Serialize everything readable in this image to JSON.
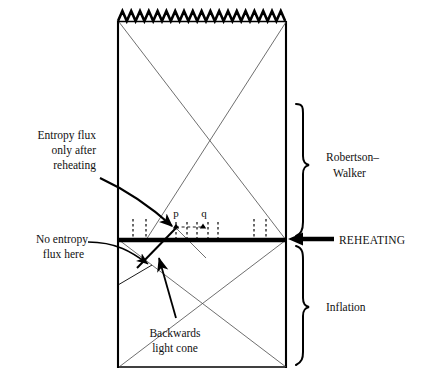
{
  "figure": {
    "background_color": "#ffffff",
    "ink_color": "#000000",
    "thin_line_color": "#3a3a3a"
  },
  "annotations": {
    "entropy_flux_after": {
      "line1": "Entropy  flux",
      "line2": "only  after",
      "line3": "reheating"
    },
    "no_entropy_flux": {
      "line1": "No  entropy",
      "line2": "flux  here"
    },
    "backwards_light_cone": {
      "line1": "Backwards",
      "line2": "light  cone"
    }
  },
  "brackets": {
    "upper": {
      "label_line1": "Robertson–",
      "label_line2": "Walker"
    },
    "lower": {
      "label_line1": "Inflation"
    }
  },
  "reheating": {
    "label": "REHEATING"
  },
  "points": [
    {
      "id": "p",
      "label": "p",
      "x": 176,
      "y": 227
    },
    {
      "id": "q",
      "label": "q",
      "x": 203,
      "y": 227
    }
  ],
  "entropy_flux_ticks": {
    "count_left": 2,
    "count_middle": 5,
    "count_right": 2,
    "description": "dashed vertical entropy-flux worldlines above reheating surface"
  },
  "regions": {
    "upper_label": "Robertson–Walker",
    "lower_label": "Inflation",
    "boundary_label": "REHEATING"
  },
  "geometry": {
    "frame_left": 117,
    "frame_right": 287,
    "frame_top": 21,
    "frame_bottom": 368,
    "reheating_y": 240,
    "sawtooth_teeth": 19
  }
}
